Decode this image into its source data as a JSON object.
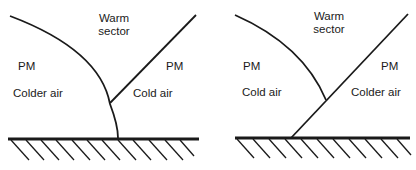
{
  "diagrams": [
    {
      "id": "left",
      "warm_sector": [
        "Warm",
        "sector"
      ],
      "left_mass": {
        "name": "PM",
        "desc": "Colder air"
      },
      "right_mass": {
        "name": "PM",
        "desc": "Cold air"
      }
    },
    {
      "id": "right",
      "warm_sector": [
        "Warm",
        "sector"
      ],
      "left_mass": {
        "name": "PM",
        "desc": "Cold air"
      },
      "right_mass": {
        "name": "PM",
        "desc": "Colder air"
      }
    }
  ],
  "colors": {
    "line": "#1a1a1a",
    "background": "#ffffff"
  }
}
